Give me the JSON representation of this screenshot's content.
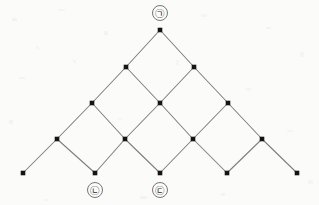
{
  "figure": {
    "kind": "diamond-lattice-diagram",
    "background_color": "#fbfbf9",
    "edge_color": "#7d7d7d",
    "node_color": "#141414",
    "label_circle_color": "#6e6e6e",
    "width": 319,
    "height": 205
  },
  "diagram_data": {
    "type": "graph",
    "description": "Rotated square (diamond) lattice arranged in a triangle with five rows",
    "row_count": 5,
    "node_counts_per_row": [
      1,
      2,
      3,
      4,
      5
    ],
    "row_y": [
      30,
      67,
      103,
      139,
      173
    ],
    "horizontal_spacing": 68,
    "node_radius": 2.3,
    "nodes": [
      {
        "id": "n0-0",
        "row": 0,
        "col": 0,
        "x": 160,
        "y": 30,
        "label": "㉠",
        "label_x": 160,
        "label_y": 13
      },
      {
        "id": "n1-0",
        "row": 1,
        "col": 0,
        "x": 126,
        "y": 67,
        "label": "",
        "label_x": null,
        "label_y": null
      },
      {
        "id": "n1-1",
        "row": 1,
        "col": 1,
        "x": 194,
        "y": 67,
        "label": "",
        "label_x": null,
        "label_y": null
      },
      {
        "id": "n2-0",
        "row": 2,
        "col": 0,
        "x": 92,
        "y": 103,
        "label": "",
        "label_x": null,
        "label_y": null
      },
      {
        "id": "n2-1",
        "row": 2,
        "col": 1,
        "x": 160,
        "y": 103,
        "label": "",
        "label_x": null,
        "label_y": null
      },
      {
        "id": "n2-2",
        "row": 2,
        "col": 2,
        "x": 228,
        "y": 103,
        "label": "",
        "label_x": null,
        "label_y": null
      },
      {
        "id": "n3-0",
        "row": 3,
        "col": 0,
        "x": 57,
        "y": 139,
        "label": "",
        "label_x": null,
        "label_y": null
      },
      {
        "id": "n3-1",
        "row": 3,
        "col": 1,
        "x": 125,
        "y": 139,
        "label": "",
        "label_x": null,
        "label_y": null
      },
      {
        "id": "n3-2",
        "row": 3,
        "col": 2,
        "x": 193,
        "y": 139,
        "label": "",
        "label_x": null,
        "label_y": null
      },
      {
        "id": "n3-3",
        "row": 3,
        "col": 3,
        "x": 262,
        "y": 139,
        "label": "",
        "label_x": null,
        "label_y": null
      },
      {
        "id": "n4-0",
        "row": 4,
        "col": 0,
        "x": 23,
        "y": 173,
        "label": "",
        "label_x": null,
        "label_y": null
      },
      {
        "id": "n4-1",
        "row": 4,
        "col": 1,
        "x": 95,
        "y": 173,
        "label": "㉡",
        "label_x": 95,
        "label_y": 190
      },
      {
        "id": "n4-2",
        "row": 4,
        "col": 2,
        "x": 160,
        "y": 173,
        "label": "㉢",
        "label_x": 160,
        "label_y": 190
      },
      {
        "id": "n4-3",
        "row": 4,
        "col": 3,
        "x": 227,
        "y": 173,
        "label": "",
        "label_x": null,
        "label_y": null
      },
      {
        "id": "n4-4",
        "row": 4,
        "col": 4,
        "x": 297,
        "y": 173,
        "label": "",
        "label_x": null,
        "label_y": null
      }
    ],
    "edges": [
      {
        "from": "n0-0",
        "to": "n1-0"
      },
      {
        "from": "n0-0",
        "to": "n1-1"
      },
      {
        "from": "n1-0",
        "to": "n2-0"
      },
      {
        "from": "n1-0",
        "to": "n2-1"
      },
      {
        "from": "n1-1",
        "to": "n2-1"
      },
      {
        "from": "n1-1",
        "to": "n2-2"
      },
      {
        "from": "n2-0",
        "to": "n3-0"
      },
      {
        "from": "n2-0",
        "to": "n3-1"
      },
      {
        "from": "n2-1",
        "to": "n3-1"
      },
      {
        "from": "n2-1",
        "to": "n3-2"
      },
      {
        "from": "n2-2",
        "to": "n3-2"
      },
      {
        "from": "n2-2",
        "to": "n3-3"
      },
      {
        "from": "n3-0",
        "to": "n4-0"
      },
      {
        "from": "n3-0",
        "to": "n4-1"
      },
      {
        "from": "n3-1",
        "to": "n4-1"
      },
      {
        "from": "n3-1",
        "to": "n4-2"
      },
      {
        "from": "n3-2",
        "to": "n4-2"
      },
      {
        "from": "n3-2",
        "to": "n4-3"
      },
      {
        "from": "n3-3",
        "to": "n4-3"
      },
      {
        "from": "n3-3",
        "to": "n4-4"
      }
    ],
    "labels": [
      {
        "text": "㉠",
        "node": "n0-0",
        "position": "above",
        "circle_radius": 7.5
      },
      {
        "text": "㉡",
        "node": "n4-1",
        "position": "below",
        "circle_radius": 7.5
      },
      {
        "text": "㉢",
        "node": "n4-2",
        "position": "below",
        "circle_radius": 7.5
      }
    ]
  },
  "texture": {
    "specks": [
      {
        "x": 12,
        "y": 18,
        "w": 5,
        "h": 3,
        "o": 0.05
      },
      {
        "x": 58,
        "y": 9,
        "w": 7,
        "h": 2,
        "o": 0.04
      },
      {
        "x": 104,
        "y": 31,
        "w": 4,
        "h": 4,
        "o": 0.05
      },
      {
        "x": 201,
        "y": 14,
        "w": 6,
        "h": 3,
        "o": 0.04
      },
      {
        "x": 266,
        "y": 27,
        "w": 5,
        "h": 2,
        "o": 0.05
      },
      {
        "x": 300,
        "y": 52,
        "w": 4,
        "h": 5,
        "o": 0.04
      },
      {
        "x": 19,
        "y": 77,
        "w": 6,
        "h": 2,
        "o": 0.05
      },
      {
        "x": 73,
        "y": 60,
        "w": 3,
        "h": 3,
        "o": 0.04
      },
      {
        "x": 246,
        "y": 88,
        "w": 5,
        "h": 3,
        "o": 0.04
      },
      {
        "x": 9,
        "y": 120,
        "w": 4,
        "h": 4,
        "o": 0.05
      },
      {
        "x": 287,
        "y": 130,
        "w": 6,
        "h": 2,
        "o": 0.04
      },
      {
        "x": 140,
        "y": 196,
        "w": 7,
        "h": 3,
        "o": 0.05
      },
      {
        "x": 44,
        "y": 199,
        "w": 5,
        "h": 2,
        "o": 0.04
      },
      {
        "x": 221,
        "y": 193,
        "w": 4,
        "h": 3,
        "o": 0.05
      },
      {
        "x": 308,
        "y": 180,
        "w": 5,
        "h": 4,
        "o": 0.04
      },
      {
        "x": 176,
        "y": 60,
        "w": 3,
        "h": 5,
        "o": 0.03
      },
      {
        "x": 117,
        "y": 118,
        "w": 5,
        "h": 2,
        "o": 0.03
      },
      {
        "x": 36,
        "y": 46,
        "w": 3,
        "h": 3,
        "o": 0.04
      }
    ]
  }
}
